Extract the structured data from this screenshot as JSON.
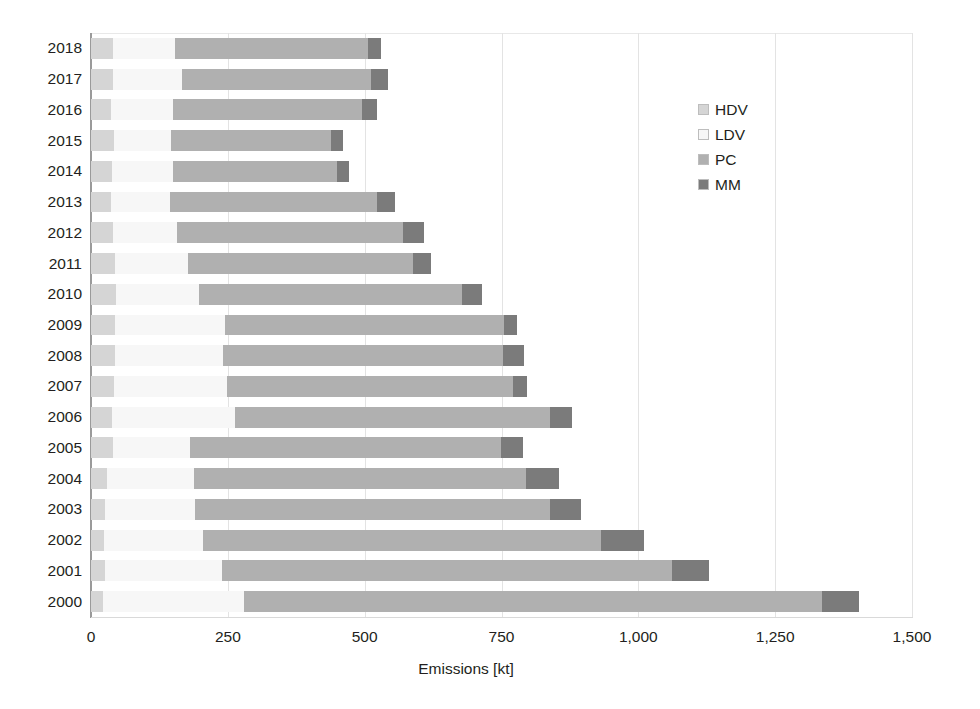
{
  "chart_data": {
    "type": "bar",
    "orientation": "horizontal",
    "stacked": true,
    "title": "",
    "xlabel": "Emissions [kt]",
    "ylabel": "",
    "xlim": [
      0,
      1500
    ],
    "xticks": [
      0,
      250,
      500,
      750,
      1000,
      1250,
      1500
    ],
    "xtick_labels": [
      "0",
      "250",
      "500",
      "750",
      "1,000",
      "1,250",
      "1,500"
    ],
    "grid": true,
    "legend_position": "upper right",
    "categories": [
      "2018",
      "2017",
      "2016",
      "2015",
      "2014",
      "2013",
      "2012",
      "2011",
      "2010",
      "2009",
      "2008",
      "2007",
      "2006",
      "2005",
      "2004",
      "2003",
      "2002",
      "2001",
      "2000"
    ],
    "series": [
      {
        "name": "HDV",
        "color": "#d5d5d5",
        "values": [
          40,
          40,
          37,
          42,
          38,
          37,
          40,
          43,
          45,
          43,
          43,
          42,
          38,
          40,
          30,
          25,
          24,
          25,
          22
        ]
      },
      {
        "name": "LDV",
        "color": "#f7f7f7",
        "values": [
          113,
          126,
          113,
          105,
          112,
          107,
          118,
          134,
          152,
          202,
          198,
          206,
          226,
          140,
          158,
          165,
          180,
          214,
          258
        ]
      },
      {
        "name": "PC",
        "color": "#b0b0b0",
        "values": [
          353,
          346,
          346,
          291,
          300,
          378,
          412,
          411,
          480,
          510,
          512,
          523,
          574,
          570,
          607,
          648,
          727,
          823,
          1055
        ]
      },
      {
        "name": "MM",
        "color": "#7b7b7b",
        "values": [
          24,
          31,
          27,
          23,
          21,
          34,
          38,
          34,
          37,
          24,
          38,
          25,
          40,
          39,
          60,
          58,
          79,
          67,
          68
        ]
      }
    ]
  },
  "legend": {
    "items": [
      {
        "label": "HDV",
        "color": "#d5d5d5"
      },
      {
        "label": "LDV",
        "color": "#f7f7f7"
      },
      {
        "label": "PC",
        "color": "#b0b0b0"
      },
      {
        "label": "MM",
        "color": "#7b7b7b"
      }
    ]
  },
  "axis": {
    "x_title": "Emissions [kt]"
  }
}
